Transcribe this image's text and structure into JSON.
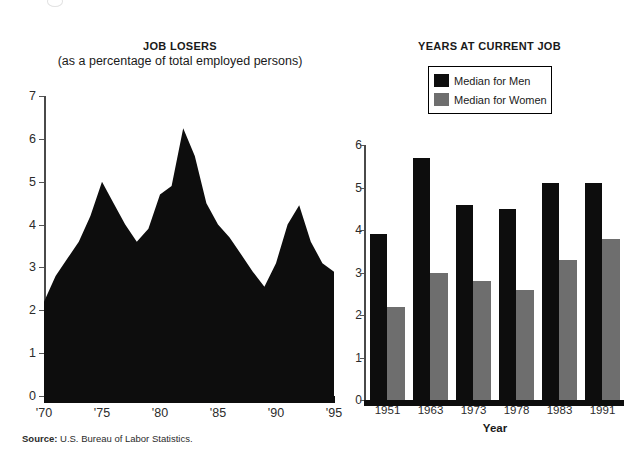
{
  "source": {
    "prefix": "Source:",
    "text": " U.S. Bureau of Labor Statistics."
  },
  "colors": {
    "men": "#0d0d0d",
    "women": "#6e6e6e",
    "axis": "#4a4a4a",
    "background": "#ffffff"
  },
  "left": {
    "title": "JOB LOSERS",
    "subtitle": "(as a percentage of total employed persons)"
  },
  "right": {
    "title": "YEARS AT CURRENT JOB",
    "legend": {
      "men_label": "Median for Men",
      "women_label": "Median for Women"
    }
  },
  "chart_data": [
    {
      "type": "area",
      "title": "JOB LOSERS",
      "subtitle": "(as a percentage of total employed persons)",
      "xlabel": "",
      "ylabel": "",
      "ylim": [
        0,
        7
      ],
      "yticks": [
        0,
        1,
        2,
        3,
        4,
        5,
        6,
        7
      ],
      "ytick_labels": [
        "0",
        "1",
        "2",
        "3",
        "4",
        "5",
        "6",
        "7"
      ],
      "xlim": [
        1970,
        1995
      ],
      "xticks": [
        1970,
        1975,
        1980,
        1985,
        1990,
        1995
      ],
      "xtick_labels": [
        "'70",
        "'75",
        "'80",
        "'85",
        "'90",
        "'95"
      ],
      "grid": false,
      "legend": "none",
      "fill_color": "#0d0d0d",
      "x": [
        1970,
        1971,
        1972,
        1973,
        1974,
        1975,
        1976,
        1977,
        1978,
        1979,
        1980,
        1981,
        1982,
        1983,
        1984,
        1985,
        1986,
        1987,
        1988,
        1989,
        1990,
        1991,
        1992,
        1993,
        1994,
        1995
      ],
      "values": [
        2.2,
        2.8,
        3.2,
        3.6,
        4.2,
        5.0,
        4.5,
        4.0,
        3.6,
        3.9,
        4.7,
        4.9,
        6.25,
        5.6,
        4.5,
        4.0,
        3.7,
        3.3,
        2.9,
        2.55,
        3.1,
        4.0,
        4.45,
        3.6,
        3.1,
        2.9
      ]
    },
    {
      "type": "bar",
      "title": "YEARS AT CURRENT JOB",
      "xlabel": "Year",
      "ylabel": "",
      "ylim": [
        0,
        6
      ],
      "yticks": [
        0,
        1,
        2,
        3,
        4,
        5,
        6
      ],
      "ytick_labels": [
        "0",
        "1",
        "2",
        "3",
        "4",
        "5",
        "6"
      ],
      "categories": [
        "1951",
        "1963",
        "1973",
        "1978",
        "1983",
        "1991"
      ],
      "grid": false,
      "legend": "top-left-box",
      "series": [
        {
          "name": "Median for Men",
          "color": "#0d0d0d",
          "values": [
            3.9,
            5.7,
            4.6,
            4.5,
            5.1,
            5.1
          ]
        },
        {
          "name": "Median for Women",
          "color": "#6e6e6e",
          "values": [
            2.2,
            3.0,
            2.8,
            2.6,
            3.3,
            3.8
          ]
        }
      ]
    }
  ]
}
